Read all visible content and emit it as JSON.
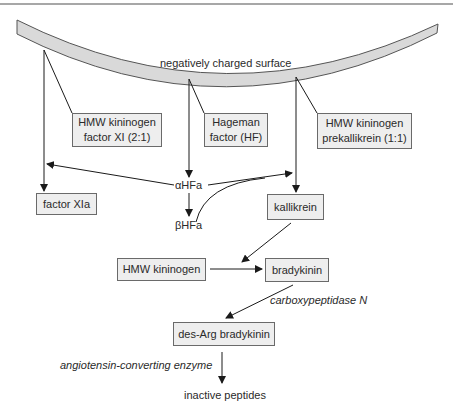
{
  "surface": {
    "label": "negatively charged surface"
  },
  "complexes": [
    {
      "line1": "HMW kininogen",
      "line2": "factor XI (2:1)"
    },
    {
      "line1": "Hageman",
      "line2": "factor (HF)"
    },
    {
      "line1": "HMW kininogen",
      "line2": "prekallikrein (1:1)"
    }
  ],
  "intermediates": {
    "alpha_hfa": "αHFa",
    "beta_hfa": "βHFa"
  },
  "products": {
    "factor_xia": "factor XIa",
    "kallikrein": "kallikrein",
    "hmw_kininogen": "HMW kininogen",
    "bradykinin": "bradykinin",
    "des_arg_bradykinin": "des-Arg bradykinin",
    "inactive_peptides": "inactive peptides"
  },
  "enzymes": {
    "carboxypeptidase": "carboxypeptidase N",
    "ace": "angiotensin-converting enzyme"
  },
  "colors": {
    "surface_fill": "#d9d9d9",
    "box_fill": "#eeeeee",
    "line": "#1a1a1a",
    "border": "#6a6a6a"
  }
}
